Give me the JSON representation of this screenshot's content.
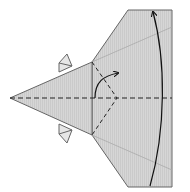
{
  "diagram": {
    "type": "origami-fold-step",
    "colors": {
      "paper": "#d4d4d4",
      "edge": "#555555",
      "crease": "#222222",
      "faint_crease": "#aaaaaa",
      "arrow": "#111111"
    },
    "elements": [
      "triangle-point-left",
      "trapezoid-body-right",
      "top-tab",
      "bottom-tab",
      "horizontal-valley-fold-centerline",
      "dashed-vee-crease",
      "curved-fold-arrow-small",
      "curved-fold-arrow-large"
    ]
  }
}
